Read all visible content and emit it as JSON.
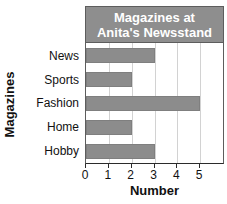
{
  "chart_data": {
    "type": "bar",
    "orientation": "horizontal",
    "title": "Magazines at Anita's Newsstand",
    "title_lines": [
      "Magazines at",
      "Anita's Newsstand"
    ],
    "categories": [
      "News",
      "Sports",
      "Fashion",
      "Home",
      "Hobby"
    ],
    "values": [
      3,
      2,
      5,
      2,
      3
    ],
    "xlabel": "Number",
    "ylabel": "Magazines",
    "xlim": [
      0,
      6
    ],
    "x_ticks": [
      0,
      1,
      2,
      3,
      4,
      5
    ],
    "x_tick_labels": [
      "0",
      "1",
      "2",
      "3",
      "4",
      "5"
    ],
    "grid": true,
    "grid_axis": "x",
    "legend": false,
    "colors": {
      "bar_fill": "#8c8c8c",
      "bar_stroke": "#7f7f7f",
      "title_band": "#8e8e8e",
      "title_text": "#ffffff",
      "gridline": "#d2d2d2",
      "axis": "#2b2b2b",
      "plot_background": "#ffffff",
      "text": "#111111"
    }
  }
}
